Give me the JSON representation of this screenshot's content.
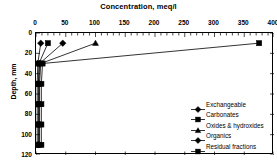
{
  "chart_data": {
    "type": "line",
    "title": "Concentration, meq/l",
    "xlabel": "Concentration, meq/l",
    "ylabel": "Depth, mm",
    "xlim": [
      0,
      400
    ],
    "ylim": [
      0,
      120
    ],
    "y_inverted": true,
    "grid": false,
    "legend_position": "inside-right-bottom",
    "xticks": [
      "0",
      "50",
      "100",
      "150",
      "200",
      "250",
      "300",
      "350",
      "400"
    ],
    "xtick_values": [
      0,
      50,
      100,
      150,
      200,
      250,
      300,
      350,
      400
    ],
    "yticks": [
      "0",
      "20",
      "40",
      "60",
      "80",
      "100",
      "120"
    ],
    "ytick_values": [
      0,
      20,
      40,
      60,
      80,
      100,
      120
    ],
    "depths": [
      10,
      30,
      50,
      70,
      90,
      110
    ],
    "series": [
      {
        "name": "Exchangeable",
        "marker": "diamond",
        "color": "#000000",
        "values": [
          8,
          3,
          2,
          2,
          2,
          2
        ]
      },
      {
        "name": "Carbonates",
        "marker": "square",
        "color": "#000000",
        "values": [
          20,
          5,
          4,
          4,
          4,
          4
        ]
      },
      {
        "name": "Oxides & hydroxides",
        "marker": "triangle",
        "color": "#000000",
        "values": [
          100,
          8,
          6,
          6,
          6,
          6
        ]
      },
      {
        "name": "Organics",
        "marker": "diamond",
        "color": "#000000",
        "values": [
          45,
          6,
          5,
          5,
          5,
          5
        ]
      },
      {
        "name": "Residual fractions",
        "marker": "square",
        "color": "#000000",
        "values": [
          375,
          11,
          9,
          9,
          9,
          9
        ]
      }
    ]
  }
}
